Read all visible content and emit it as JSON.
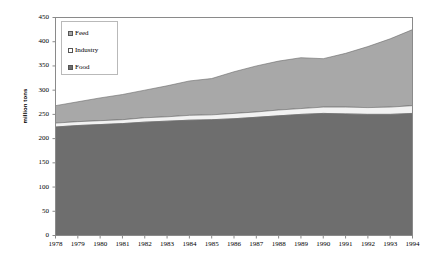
{
  "chart_data": {
    "type": "area",
    "stacked": true,
    "title": "",
    "subtitle": "",
    "xlabel": "",
    "ylabel": "million tons",
    "ylim": [
      0,
      450
    ],
    "ytick_step": 50,
    "yticks": [
      450,
      400,
      350,
      300,
      250,
      200,
      150,
      100,
      50,
      0
    ],
    "grid": false,
    "legend_position": "top-left-inside",
    "categories": [
      1978,
      1979,
      1980,
      1981,
      1982,
      1983,
      1984,
      1985,
      1986,
      1987,
      1988,
      1989,
      1990,
      1991,
      1992,
      1993,
      1994
    ],
    "x_tick_labels": [
      "1978",
      "1979",
      "1980",
      "1981",
      "1982",
      "1983",
      "1984",
      "1985",
      "1986",
      "1987",
      "1988",
      "1989",
      "1990",
      "1991",
      "1992",
      "1993",
      "1994"
    ],
    "series": [
      {
        "name": "Food",
        "color": "#6e6e6e",
        "stack_order": 1,
        "values": [
          224,
          227,
          229,
          231,
          234,
          236,
          238,
          239,
          241,
          244,
          247,
          250,
          252,
          251,
          250,
          250,
          252
        ]
      },
      {
        "name": "Industry",
        "color": "#f2f2f2",
        "stack_order": 2,
        "values": [
          8,
          8,
          8,
          8,
          9,
          9,
          10,
          10,
          11,
          11,
          12,
          12,
          13,
          14,
          14,
          15,
          16
        ]
      },
      {
        "name": "Feed",
        "color": "#a8a8a8",
        "stack_order": 3,
        "values": [
          36,
          41,
          47,
          52,
          57,
          64,
          71,
          75,
          86,
          95,
          101,
          105,
          100,
          111,
          126,
          141,
          157
        ]
      }
    ],
    "series_totals": [
      268,
      276,
      284,
      291,
      300,
      309,
      319,
      324,
      338,
      350,
      360,
      367,
      365,
      376,
      390,
      406,
      425
    ],
    "legend_entries": [
      {
        "label": "Feed",
        "color": "#a8a8a8"
      },
      {
        "label": "Industry",
        "color": "#ffffff"
      },
      {
        "label": "Food",
        "color": "#6e6e6e"
      }
    ],
    "axis_color": "#8a8a8a",
    "plot_border_color": "#8a8a8a",
    "background": "#ffffff"
  }
}
